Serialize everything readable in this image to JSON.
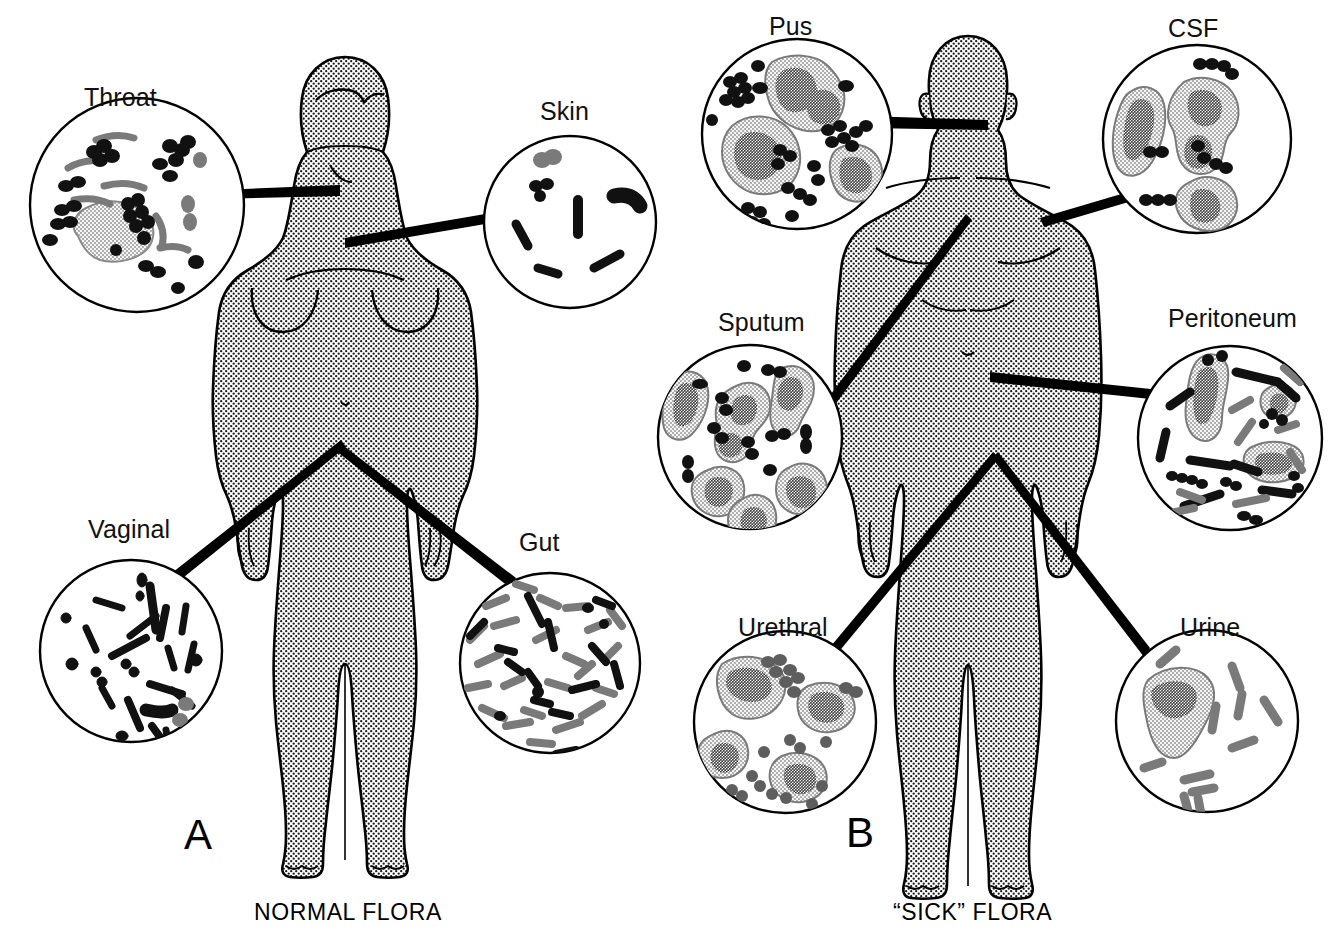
{
  "figure": {
    "colors": {
      "ink": "#111111",
      "gray_organism": "#7a7a7a",
      "body_fill_stipple": "#9a9a9a",
      "cell_cytoplasm": "#f2f2f2",
      "background": "#ffffff"
    }
  },
  "panels": [
    {
      "letter": "A",
      "caption": "NORMAL FLORA",
      "body": "female-silhouette",
      "specimens": [
        {
          "label": "Throat",
          "cx": 137,
          "cy": 205,
          "r": 108,
          "content": "mixed black cocci clusters, gray curved rods, one epithelial cell",
          "has_host_cell": true,
          "organisms": "abundant mixed"
        },
        {
          "label": "Skin",
          "cx": 570,
          "cy": 222,
          "r": 87,
          "content": "sparse black cocci pairs and short rods, one gray coccus pair",
          "has_host_cell": false,
          "organisms": "scanty"
        },
        {
          "label": "Vaginal",
          "cx": 131,
          "cy": 651,
          "r": 92,
          "content": "numerous black bacilli (lactobacilli), two gray cocci",
          "has_host_cell": false,
          "organisms": "abundant rods"
        },
        {
          "label": "Gut",
          "cx": 550,
          "cy": 663,
          "r": 91,
          "content": "dense mixed black and gray bacilli",
          "has_host_cell": false,
          "organisms": "very abundant mixed"
        }
      ]
    },
    {
      "letter": "B",
      "caption": "“SICK” FLORA",
      "body": "male-silhouette",
      "specimens": [
        {
          "label": "Pus",
          "cx": 797,
          "cy": 134,
          "r": 96,
          "content": "four neutrophils with black cocci clusters",
          "has_host_cell": true,
          "organisms": "cocci in clusters"
        },
        {
          "label": "CSF",
          "cx": 1197,
          "cy": 139,
          "r": 95,
          "content": "three neutrophils with black diplococci",
          "has_host_cell": true,
          "organisms": "diplococci"
        },
        {
          "label": "Sputum",
          "cx": 750,
          "cy": 437,
          "r": 93,
          "content": "six neutrophils with black diplococci",
          "has_host_cell": true,
          "organisms": "diplococci"
        },
        {
          "label": "Peritoneum",
          "cx": 1230,
          "cy": 438,
          "r": 93,
          "content": "mixed black and gray bacilli, cocci chains, three neutrophils",
          "has_host_cell": true,
          "organisms": "mixed flora"
        },
        {
          "label": "Urethral",
          "cx": 785,
          "cy": 722,
          "r": 92,
          "content": "four neutrophils with intracellular gray diplococci",
          "has_host_cell": true,
          "organisms": "intracellular diplococci"
        },
        {
          "label": "Urine",
          "cx": 1207,
          "cy": 721,
          "r": 92,
          "content": "one neutrophil with sparse gray bacilli",
          "has_host_cell": true,
          "organisms": "bacilli"
        }
      ]
    }
  ]
}
